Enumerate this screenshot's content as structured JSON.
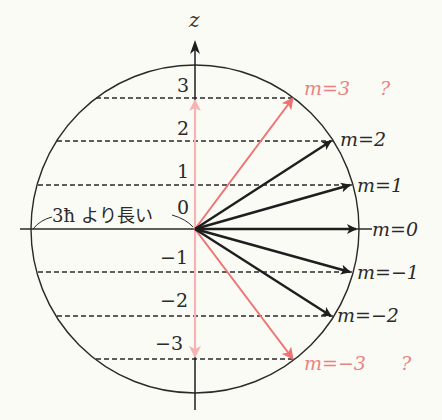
{
  "diagram": {
    "axis_label": "z",
    "note_label": "3ħ より長い",
    "z_ticks": [
      {
        "label": "3",
        "y": 98,
        "ly": 93
      },
      {
        "label": "2",
        "y": 141,
        "ly": 136
      },
      {
        "label": "1",
        "y": 185,
        "ly": 180
      },
      {
        "label": "0",
        "y": 229,
        "ly": 215
      },
      {
        "label": "−1",
        "y": 272,
        "ly": 265
      },
      {
        "label": "−2",
        "y": 316,
        "ly": 308
      },
      {
        "label": "−3",
        "y": 359,
        "ly": 352
      }
    ],
    "vectors": [
      {
        "m": "3",
        "label": "m=3",
        "suffix": "?",
        "tip": [
          293,
          98
        ],
        "color": "#f07272",
        "allowed": false
      },
      {
        "m": "2",
        "label": "m=2",
        "tip": [
          331,
          141
        ],
        "color": "#1e1e1e",
        "allowed": true
      },
      {
        "m": "1",
        "label": "m=1",
        "tip": [
          350,
          185
        ],
        "color": "#1e1e1e",
        "allowed": true
      },
      {
        "m": "0",
        "label": "m=0",
        "tip": [
          356,
          229
        ],
        "color": "#1e1e1e",
        "allowed": true
      },
      {
        "m": "-1",
        "label": "m=−1",
        "tip": [
          350,
          272
        ],
        "color": "#1e1e1e",
        "allowed": true
      },
      {
        "m": "-2",
        "label": "m=−2",
        "tip": [
          331,
          316
        ],
        "color": "#1e1e1e",
        "allowed": true
      },
      {
        "m": "-3",
        "label": "m=−3",
        "suffix": "?",
        "tip": [
          293,
          359
        ],
        "color": "#f07272",
        "allowed": false
      }
    ],
    "labels": {
      "m3": "m=3",
      "m3_q": "?",
      "m2": "m=2",
      "m1": "m=1",
      "m0": "m=0",
      "mneg1": "m=−1",
      "mneg2": "m=−2",
      "mneg3": "m=−3",
      "mneg3_q": "?"
    },
    "colors": {
      "background": "#fbfbf5",
      "line": "#1e1e1e",
      "pink_strong": "#f07272",
      "pink_light": "#f5b3b3",
      "pink_text": "#e98282"
    },
    "circle": {
      "cx": 195,
      "cy": 229,
      "r": 164
    }
  }
}
